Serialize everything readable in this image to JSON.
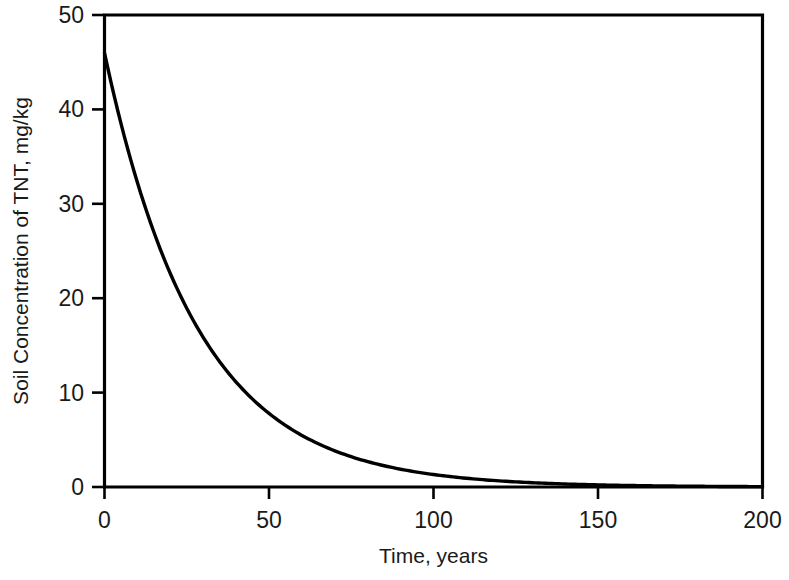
{
  "chart_data": {
    "type": "line",
    "title": "",
    "subtitle": "",
    "xlabel": "Time, years",
    "ylabel": "Soil Concentration of TNT, mg/kg",
    "xlim": [
      0,
      200
    ],
    "ylim": [
      0,
      50
    ],
    "xticks": [
      0,
      50,
      100,
      150,
      200
    ],
    "yticks": [
      0,
      10,
      20,
      30,
      40,
      50
    ],
    "xtick_labels": [
      "0",
      "50",
      "100",
      "150",
      "200"
    ],
    "ytick_labels": [
      "0",
      "10",
      "20",
      "30",
      "40",
      "50"
    ],
    "grid": false,
    "legend": null,
    "annotations": [],
    "line_color": "#000000",
    "series": [
      {
        "name": "Soil Concentration of TNT",
        "model": "C(t) = 46 * exp(-0.0355 * t)",
        "x": [
          0,
          5,
          10,
          15,
          20,
          25,
          30,
          35,
          40,
          45,
          50,
          60,
          70,
          80,
          90,
          100,
          110,
          120,
          130,
          140,
          150,
          160,
          170,
          180,
          190,
          200
        ],
        "values": [
          46.0,
          38.5,
          32.3,
          27.0,
          22.6,
          18.9,
          15.9,
          13.3,
          11.1,
          9.3,
          7.8,
          5.5,
          3.8,
          2.7,
          1.9,
          1.3,
          0.9,
          0.7,
          0.5,
          0.3,
          0.2,
          0.2,
          0.1,
          0.1,
          0.1,
          0.0
        ]
      }
    ]
  },
  "axes": {
    "ylabel": "Soil Concentration of TNT, mg/kg",
    "xlabel": "Time, years"
  }
}
